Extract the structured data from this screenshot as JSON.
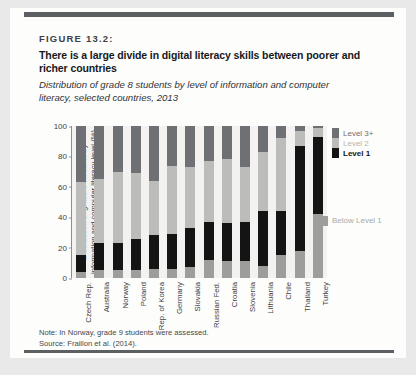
{
  "card": {
    "figure_label": "FIGURE 13.2:",
    "headline": "There is a large divide in digital literacy skills between poorer and richer countries",
    "subhead": "Distribution of grade 8 students by level of information and computer literacy, selected countries, 2013",
    "note": "Note: In Norway, grade 9 students were assessed.",
    "source": "Source: Fraillon et al. (2014)."
  },
  "legend": {
    "level3": "Level 3+",
    "level2": "Level 2",
    "level1": "Level 1",
    "below": "Below Level 1"
  },
  "colors": {
    "level3": "#6e7073",
    "level2": "#bcbcba",
    "level1": "#141414",
    "below": "#9d9e9c",
    "rule": "#5d6063",
    "plot_bg": "#f3f2f0"
  },
  "chart_data": {
    "type": "bar",
    "stacked": true,
    "title": "Distribution of grade 8 students by level of information and computer literacy, selected countries, 2013",
    "xlabel": "",
    "ylabel": "Distribution of grade 8 students by information and computer literacy level (%)",
    "ylim": [
      0,
      100
    ],
    "yticks": [
      0,
      20,
      40,
      60,
      80,
      100
    ],
    "grid": false,
    "legend_position": "right",
    "categories": [
      "Czech Rep.",
      "Australia",
      "Norway",
      "Poland",
      "Rep. of Korea",
      "Germany",
      "Slovakia",
      "Russian Fed.",
      "Croatia",
      "Slovenia",
      "Lithuania",
      "Chile",
      "Thailand",
      "Turkey"
    ],
    "series": [
      {
        "name": "Below Level 1",
        "values": [
          4,
          5,
          5,
          5,
          6,
          6,
          7,
          12,
          11,
          11,
          8,
          15,
          18,
          42
        ]
      },
      {
        "name": "Level 1",
        "values": [
          11,
          18,
          18,
          21,
          22,
          23,
          26,
          25,
          25,
          26,
          36,
          29,
          69,
          51
        ]
      },
      {
        "name": "Level 2",
        "values": [
          48,
          42,
          47,
          43,
          36,
          45,
          40,
          40,
          42,
          36,
          39,
          48,
          10,
          6
        ]
      },
      {
        "name": "Level 3+",
        "values": [
          37,
          35,
          30,
          31,
          36,
          26,
          27,
          23,
          22,
          27,
          17,
          8,
          3,
          1
        ]
      }
    ],
    "cumulative_tops": {
      "below_level_1": [
        4,
        5,
        5,
        5,
        6,
        6,
        7,
        12,
        11,
        11,
        8,
        15,
        18,
        42
      ],
      "level_1": [
        15,
        23,
        23,
        26,
        28,
        29,
        33,
        37,
        36,
        37,
        44,
        44,
        87,
        93
      ],
      "level_2": [
        63,
        65,
        70,
        69,
        64,
        74,
        73,
        77,
        78,
        73,
        83,
        92,
        97,
        99
      ],
      "level_3_plus": [
        100,
        100,
        100,
        100,
        100,
        100,
        100,
        100,
        100,
        100,
        100,
        100,
        100,
        100
      ]
    }
  }
}
